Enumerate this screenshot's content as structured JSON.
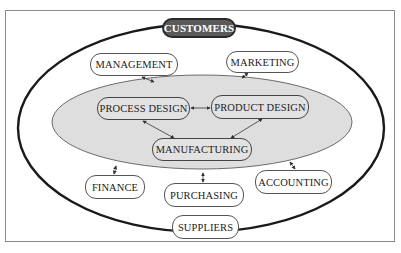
{
  "diagram": {
    "colors": {
      "outer_ellipse_stroke": "#1a1a1a",
      "inner_ellipse_fill": "#dedede",
      "inner_ellipse_stroke": "#6a6a6a",
      "customers_fill": "#5a5a5a",
      "node_border": "#555555",
      "frame_border": "#8a8a8a"
    },
    "nodes": {
      "customers": "CUSTOMERS",
      "management": "MANAGEMENT",
      "marketing": "MARKETING",
      "process_design": "PROCESS DESIGN",
      "product_design": "PRODUCT DESIGN",
      "manufacturing": "MANUFACTURING",
      "finance": "FINANCE",
      "purchasing": "PURCHASING",
      "accounting": "ACCOUNTING",
      "suppliers": "SUPPLIERS"
    },
    "connections": [
      {
        "from": "management",
        "to": "inner-core",
        "type": "bidirectional"
      },
      {
        "from": "marketing",
        "to": "inner-core",
        "type": "bidirectional"
      },
      {
        "from": "process_design",
        "to": "product_design",
        "type": "bidirectional"
      },
      {
        "from": "process_design",
        "to": "manufacturing",
        "type": "bidirectional"
      },
      {
        "from": "product_design",
        "to": "manufacturing",
        "type": "bidirectional"
      },
      {
        "from": "finance",
        "to": "inner-core",
        "type": "bidirectional"
      },
      {
        "from": "purchasing",
        "to": "inner-core",
        "type": "bidirectional"
      },
      {
        "from": "accounting",
        "to": "inner-core",
        "type": "bidirectional"
      }
    ]
  }
}
